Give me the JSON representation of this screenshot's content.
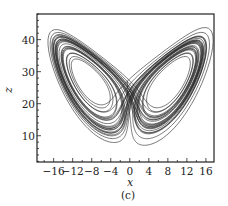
{
  "chart_data": {
    "type": "line",
    "title": "",
    "caption": "(c)",
    "xlabel": "x",
    "ylabel": "z",
    "xlim": [
      -19.5,
      17.7
    ],
    "ylim": [
      1.8,
      48
    ],
    "xticks": [
      -16,
      -12,
      -8,
      -4,
      0,
      4,
      8,
      12,
      16
    ],
    "xtick_labels": [
      "−16",
      "−12",
      "−8",
      "−4",
      "0",
      "4",
      "8",
      "12",
      "16"
    ],
    "yticks": [
      10,
      20,
      30,
      40
    ],
    "ytick_labels": [
      "10",
      "20",
      "30",
      "40"
    ],
    "grid": false,
    "legend": null,
    "series": [
      {
        "name": "Lorenz attractor trajectory (x–z projection)",
        "system": "Lorenz",
        "parameters": {
          "sigma": 10,
          "rho": 28,
          "beta": 2.6667
        },
        "initial_state": [
          -0.5,
          -0.5,
          27.0
        ],
        "description": "Butterfly-shaped chaotic trajectory with two lobes centred near (x≈-8.5, z≈27) and (x≈8.5, z≈27); outer loops reach x from about -18 to 16 and z from about 3 to 47",
        "color": "#222222"
      }
    ],
    "lobe_centers": [
      {
        "x": -8.5,
        "z": 27
      },
      {
        "x": 8.5,
        "z": 27
      }
    ],
    "extent": {
      "x_min": -18,
      "x_max": 16.5,
      "z_min": 3,
      "z_max": 47
    }
  },
  "plot": {
    "frame": {
      "left": 37,
      "top": 14,
      "right": 214,
      "bottom": 162
    },
    "x_axis_y_label_offset": 11,
    "xlabel_pos": {
      "x": 130,
      "y": 186
    },
    "ylabel_pos": {
      "x": 12,
      "y": 90
    },
    "caption_pos": {
      "x": 128,
      "y": 199
    }
  }
}
